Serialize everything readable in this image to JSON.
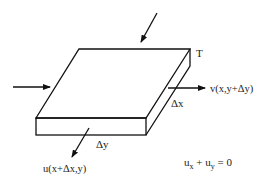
{
  "diagram": {
    "type": "plate-element-with-boundary-flows",
    "labels": {
      "corner": "T",
      "right_flow": "v(x,y+Δy)",
      "bottom_flow": "u(x+Δx,y)",
      "dx": "Δx",
      "dy": "Δy",
      "equation_u": "u",
      "equation_x": "x",
      "equation_plus": " + ",
      "equation_y": "y",
      "equation_rhs": " = 0"
    },
    "arrows": [
      {
        "name": "top-inflow-arrow",
        "from": [
          157,
          13
        ],
        "to": [
          141,
          42
        ]
      },
      {
        "name": "left-inflow-arrow",
        "from": [
          13,
          87
        ],
        "to": [
          50,
          87
        ]
      },
      {
        "name": "right-outflow-arrow",
        "from": [
          168,
          88
        ],
        "to": [
          205,
          88
        ]
      },
      {
        "name": "bottom-outflow-arrow",
        "from": [
          89,
          128
        ],
        "to": [
          72,
          157
        ]
      }
    ],
    "colors": {
      "stroke": "#111111",
      "background": "#ffffff"
    }
  }
}
